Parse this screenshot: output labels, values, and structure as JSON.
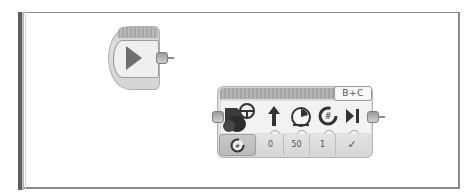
{
  "canvas": {
    "blocks": [
      {
        "type": "start",
        "name": "Start",
        "icon": "play-icon"
      },
      {
        "type": "move-steering",
        "ports": "B+C",
        "mode_icon": "steering-wheel-motor-icon",
        "mode_button_icon": "rotations-icon",
        "parameters": [
          {
            "icon": "steering-arrow-icon",
            "value": "0"
          },
          {
            "icon": "power-gauge-icon",
            "value": "50"
          },
          {
            "icon": "rotations-count-icon",
            "value": "1"
          },
          {
            "icon": "brake-at-end-icon",
            "value": "✓"
          }
        ]
      }
    ]
  },
  "colors": {
    "block_gray": "#d6d6d6",
    "frame_border": "#8a8a8a",
    "icon_dark": "#3c3c3c"
  }
}
